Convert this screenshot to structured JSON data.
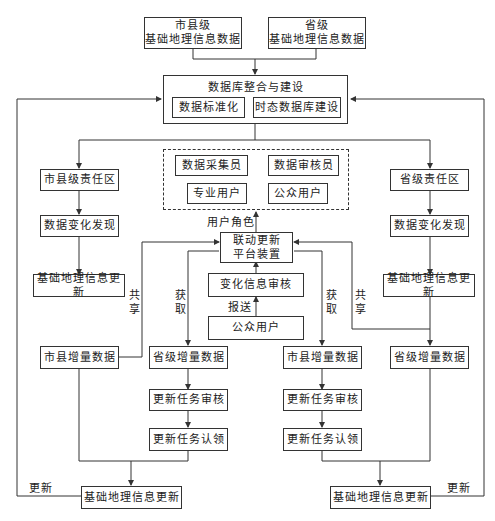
{
  "diagram": {
    "top_sources": {
      "city_county_data": "市县级\n基础地理信息数据",
      "provincial_data": "省级\n基础地理信息数据"
    },
    "integration": {
      "title": "数据库整合与建设",
      "standardization": "数据标准化",
      "temporal_db": "时态数据库建设"
    },
    "roles": {
      "collector": "数据采集员",
      "auditor": "数据审核员",
      "professional": "专业用户",
      "public": "公众用户",
      "role_label": "用户角色"
    },
    "platform": "联动更新\n平台装置",
    "center": {
      "change_audit": "变化信息审核",
      "report_label": "报送",
      "public_user": "公众用户"
    },
    "left_column": {
      "zone": "市县级责任区",
      "change_detect": "数据变化发现",
      "update": "基础地理信息更新",
      "incremental": "市县增量数据",
      "share_label": "共享"
    },
    "right_column": {
      "zone": "省级责任区",
      "change_detect": "数据变化发现",
      "update": "基础地理信息更新",
      "incremental": "省级增量数据",
      "share_label": "共享"
    },
    "mid_left": {
      "fetch_label": "获取",
      "incremental": "省级增量数据",
      "task_audit": "更新任务审核",
      "task_claim": "更新任务认领"
    },
    "mid_right": {
      "fetch_label": "获取",
      "incremental": "市县增量数据",
      "task_audit": "更新任务审核",
      "task_claim": "更新任务认领"
    },
    "bottom": {
      "left_update": "基础地理信息更新",
      "right_update": "基础地理信息更新",
      "left_update_label": "更新",
      "right_update_label": "更新"
    }
  }
}
